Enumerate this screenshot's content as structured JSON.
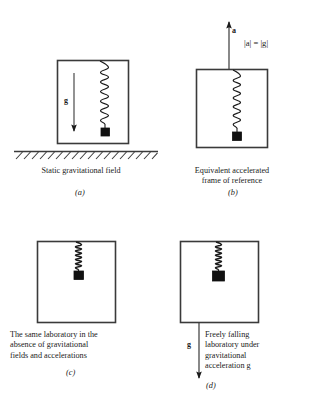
{
  "figure": {
    "title_fragment": "",
    "panels": [
      {
        "id": "(a)",
        "caption": "Static gravitational field",
        "caption_lines": [
          "Static gravitational field"
        ],
        "field_label": "g",
        "arrow_direction": "down",
        "spring_state": "stretched",
        "has_ground": true
      },
      {
        "id": "(b)",
        "caption": "Equivalent accelerated frame of reference",
        "caption_lines": [
          "Equivalent accelerated",
          "frame of reference"
        ],
        "field_label": "a",
        "relation": "|a| = |g|",
        "arrow_direction": "up",
        "spring_state": "stretched",
        "has_ground": false
      },
      {
        "id": "(c)",
        "caption": "The same laboratory in the absence of gravitational fields and accelerations",
        "caption_lines": [
          "The same laboratory in the",
          "absence of gravitational",
          "fields and accelerations"
        ],
        "field_label": "",
        "arrow_direction": "none",
        "spring_state": "relaxed",
        "has_ground": false
      },
      {
        "id": "(d)",
        "caption": "Freely falling laboratory under gravitational acceleration g",
        "caption_lines": [
          "Freely falling",
          "laboratory under",
          "gravitational",
          "acceleration  g"
        ],
        "field_label": "g",
        "arrow_direction": "down",
        "spring_state": "relaxed",
        "has_ground": false
      }
    ],
    "colors": {
      "ink": "#1a1a1a",
      "line": "#3a3a3a",
      "background": "#ffffff"
    }
  }
}
